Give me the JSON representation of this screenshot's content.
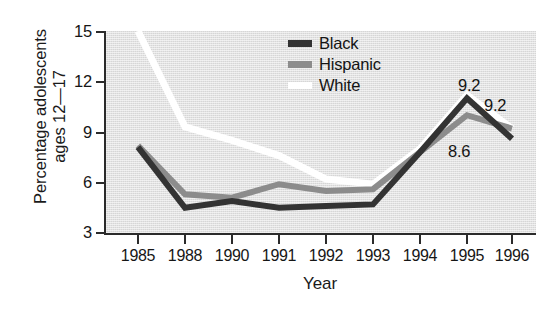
{
  "chart_data": {
    "type": "line",
    "title": "",
    "subtitle": "",
    "xlabel": "Year",
    "ylabel": "Percentage adolescents ages 12—17",
    "ylabel_line1": "Percentage adolescents",
    "ylabel_line2": "ages 12—17",
    "categories": [
      "1985",
      "1988",
      "1990",
      "1991",
      "1992",
      "1993",
      "1994",
      "1995",
      "1996"
    ],
    "x": [
      1985,
      1988,
      1990,
      1991,
      1992,
      1993,
      1994,
      1995,
      1996
    ],
    "ylim": [
      3,
      15
    ],
    "yticks": [
      15,
      12,
      9,
      6,
      3
    ],
    "xticks": [
      "1985",
      "1988",
      "1990",
      "1991",
      "1992",
      "1993",
      "1994",
      "1995",
      "1996"
    ],
    "grid": false,
    "legend_position": "top-center-right",
    "plot_background": "#d6d6d6",
    "series": [
      {
        "name": "Black",
        "color": "#333333",
        "values": [
          8.1,
          4.5,
          4.9,
          4.5,
          4.6,
          4.7,
          7.8,
          11.0,
          8.6
        ],
        "end_label": "8.6"
      },
      {
        "name": "Hispanic",
        "color": "#8c8c8c",
        "values": [
          8.2,
          5.3,
          5.1,
          5.9,
          5.5,
          5.6,
          7.8,
          10.0,
          9.2
        ],
        "end_label": "9.2"
      },
      {
        "name": "White",
        "color": "#ffffff",
        "values": [
          15.0,
          9.3,
          8.5,
          7.6,
          6.2,
          5.9,
          8.0,
          11.2,
          9.2
        ],
        "end_label": "9.2"
      }
    ],
    "annotations": [
      {
        "text": "9.2",
        "series": "White",
        "x": 1996
      },
      {
        "text": "9.2",
        "series": "Hispanic",
        "x": 1996
      },
      {
        "text": "8.6",
        "series": "Black",
        "x": 1996
      }
    ]
  },
  "legend": {
    "items": [
      {
        "label": "Black",
        "color": "#333333"
      },
      {
        "label": "Hispanic",
        "color": "#8c8c8c"
      },
      {
        "label": "White",
        "color": "#ffffff"
      }
    ]
  },
  "axes": {
    "y_title_line1": "Percentage adolescents",
    "y_title_line2": "ages 12—17",
    "x_title": "Year",
    "y_ticks": [
      "15",
      "12",
      "9",
      "6",
      "3"
    ],
    "x_ticks": [
      "1985",
      "1988",
      "1990",
      "1991",
      "1992",
      "1993",
      "1994",
      "1995",
      "1996"
    ]
  },
  "data_labels": {
    "white_1996": "9.2",
    "hispanic_1996": "9.2",
    "black_1996": "8.6"
  }
}
